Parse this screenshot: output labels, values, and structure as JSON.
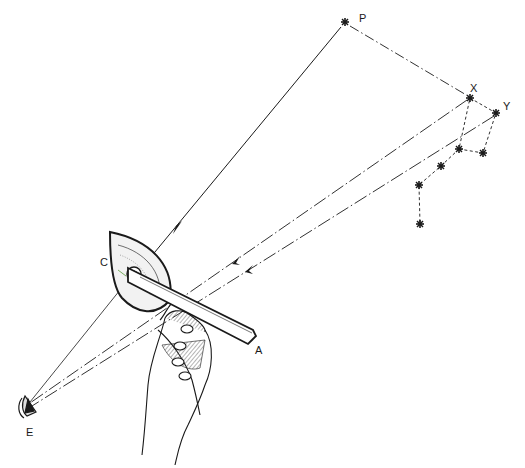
{
  "figure": {
    "colors": {
      "ink": "#1a1a1a",
      "paper": "#ffffff",
      "hatch": "#444444"
    }
  },
  "labels": {
    "pole_star": "P",
    "star_x": "X",
    "star_y": "Y",
    "eye": "E",
    "protractor_edge": "C",
    "arm_tip": "A"
  },
  "stars": [
    {
      "id": "P",
      "x": 345,
      "y": 22
    },
    {
      "id": "X",
      "x": 470,
      "y": 98
    },
    {
      "id": "Y",
      "x": 496,
      "y": 113
    },
    {
      "id": "s3",
      "x": 459,
      "y": 149
    },
    {
      "id": "s4",
      "x": 483,
      "y": 153
    },
    {
      "id": "s5",
      "x": 441,
      "y": 166
    },
    {
      "id": "s6",
      "x": 419,
      "y": 185
    },
    {
      "id": "s7",
      "x": 420,
      "y": 224
    }
  ],
  "sight_lines": [
    {
      "from": "P",
      "to": "protractor",
      "style": "solid",
      "arrow": true
    },
    {
      "from": "X",
      "to": "E",
      "style": "dash-dot",
      "arrow": true
    },
    {
      "from": "Y",
      "to": "E",
      "style": "dash-dot",
      "arrow": true
    },
    {
      "from": "P",
      "to": "X",
      "style": "dash-dot",
      "arrow": false
    }
  ]
}
